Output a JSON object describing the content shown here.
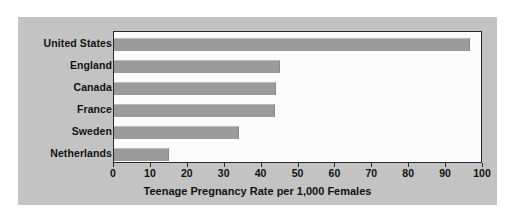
{
  "chart_data": {
    "type": "bar",
    "orientation": "horizontal",
    "title": "",
    "xlabel": "Teenage Pregnancy Rate per 1,000 Females",
    "ylabel": "",
    "categories": [
      "United States",
      "England",
      "Canada",
      "France",
      "Sweden",
      "Netherlands"
    ],
    "values": [
      96.5,
      45,
      44,
      43.5,
      34,
      15
    ],
    "xlim": [
      0,
      100
    ],
    "xticks": [
      0,
      10,
      20,
      30,
      40,
      50,
      60,
      70,
      80,
      90,
      100
    ],
    "xtick_labels": [
      "0",
      "10",
      "20",
      "30",
      "40",
      "50",
      "60",
      "70",
      "80",
      "90",
      "100"
    ],
    "grid": false,
    "legend": null,
    "series": [
      {
        "name": "Teenage pregnancy rate",
        "values": [
          96.5,
          45,
          44,
          43.5,
          34,
          15
        ]
      }
    ]
  },
  "colors": {
    "page_background": "#ffffff",
    "panel_background": "#c3c3c3",
    "plot_background": "#fbfbfb",
    "plot_border": "#2b2b2b",
    "bar_fill": "#9b9b9b",
    "bar_highlight": "#bdbdbd",
    "text": "#111111"
  }
}
